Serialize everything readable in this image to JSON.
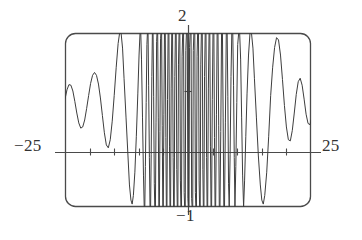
{
  "figure": {
    "kind": "graphing-calculator-viewport",
    "title": "",
    "frame": {
      "left_px": 65,
      "right_px": 311,
      "top_px": 33,
      "bottom_px": 207,
      "corner_radius_px": 10,
      "stroke_color": "#4a4a4a"
    },
    "labels": {
      "x_min": "−25",
      "x_max": "25",
      "y_max": "2",
      "y_min": "−1"
    },
    "axes": {
      "x_axis_y_px": 152,
      "y_axis_x_px": 188,
      "x_tick_values": [
        -20,
        -15,
        -10,
        -5,
        5,
        10,
        15,
        20
      ],
      "y_tick_values": [
        1
      ],
      "tick_length_px": 7,
      "stroke_color": "#4a4a4a"
    }
  },
  "chart_data": {
    "type": "line",
    "title": "",
    "xlabel": "",
    "ylabel": "",
    "xlim": [
      -25,
      25
    ],
    "ylim": [
      -1,
      2
    ],
    "grid": false,
    "legend": "none",
    "xticks": [
      -20,
      -15,
      -10,
      -5,
      0,
      5,
      10,
      15,
      20
    ],
    "yticks": [
      -1,
      0,
      1,
      2
    ],
    "series": [
      {
        "name": "f(x)",
        "description": "rapidly oscillating curve, frequency increases toward center, clipped at viewport top and bottom",
        "stroke_color": "#3d3d3d",
        "stroke_width": 1,
        "points": [
          [
            -25.0,
            0.86
          ],
          [
            -24.6,
            1.02
          ],
          [
            -24.2,
            1.11
          ],
          [
            -23.8,
            1.1
          ],
          [
            -23.4,
            1.0
          ],
          [
            -23.0,
            0.82
          ],
          [
            -22.6,
            0.62
          ],
          [
            -22.2,
            0.45
          ],
          [
            -21.8,
            0.36
          ],
          [
            -21.4,
            0.38
          ],
          [
            -21.0,
            0.5
          ],
          [
            -20.6,
            0.7
          ],
          [
            -20.2,
            0.92
          ],
          [
            -19.8,
            1.13
          ],
          [
            -19.4,
            1.27
          ],
          [
            -19.0,
            1.32
          ],
          [
            -18.6,
            1.27
          ],
          [
            -18.2,
            1.12
          ],
          [
            -17.8,
            0.88
          ],
          [
            -17.4,
            0.58
          ],
          [
            -17.0,
            0.28
          ],
          [
            -16.6,
            0.07
          ],
          [
            -16.2,
            0.02
          ],
          [
            -15.8,
            0.16
          ],
          [
            -15.4,
            0.48
          ],
          [
            -15.0,
            0.92
          ],
          [
            -14.6,
            1.4
          ],
          [
            -14.2,
            1.82
          ],
          [
            -13.9,
            2.0
          ],
          [
            -13.6,
            2.0
          ],
          [
            -13.3,
            1.74
          ],
          [
            -13.0,
            1.22
          ],
          [
            -12.6,
            0.55
          ],
          [
            -12.2,
            -0.12
          ],
          [
            -11.9,
            -0.62
          ],
          [
            -11.6,
            -0.88
          ],
          [
            -11.35,
            -0.95
          ],
          [
            -11.1,
            -0.8
          ],
          [
            -10.8,
            -0.4
          ],
          [
            -10.5,
            0.22
          ],
          [
            -10.2,
            0.95
          ],
          [
            -9.95,
            1.62
          ],
          [
            -9.75,
            2.0
          ],
          [
            -9.6,
            2.0
          ],
          [
            -9.45,
            1.55
          ],
          [
            -9.25,
            0.55
          ],
          [
            -9.05,
            -0.45
          ],
          [
            -8.9,
            -1.0
          ],
          [
            -8.78,
            -1.0
          ],
          [
            -8.66,
            -0.3
          ],
          [
            -8.5,
            0.8
          ],
          [
            -8.35,
            1.8
          ],
          [
            -8.25,
            2.0
          ],
          [
            -8.12,
            2.0
          ],
          [
            -8.0,
            1.1
          ],
          [
            -7.85,
            -0.15
          ],
          [
            -7.72,
            -1.0
          ],
          [
            -7.6,
            -1.0
          ],
          [
            -7.48,
            -0.1
          ],
          [
            -7.35,
            1.25
          ],
          [
            -7.24,
            2.0
          ],
          [
            -7.1,
            2.0
          ],
          [
            -6.98,
            0.9
          ],
          [
            -6.85,
            -0.6
          ],
          [
            -6.75,
            -1.0
          ],
          [
            -6.62,
            -1.0
          ],
          [
            -6.5,
            0.45
          ],
          [
            -6.38,
            1.85
          ],
          [
            -6.3,
            2.0
          ],
          [
            -6.16,
            2.0
          ],
          [
            -6.04,
            0.55
          ],
          [
            -5.92,
            -1.0
          ],
          [
            -5.82,
            -1.0
          ],
          [
            -5.7,
            0.3
          ],
          [
            -5.58,
            1.9
          ],
          [
            -5.5,
            2.0
          ],
          [
            -5.36,
            2.0
          ],
          [
            -5.24,
            0.4
          ],
          [
            -5.12,
            -1.0
          ],
          [
            -5.02,
            -1.0
          ],
          [
            -4.9,
            0.6
          ],
          [
            -4.78,
            2.0
          ],
          [
            -4.62,
            2.0
          ],
          [
            -4.5,
            0.2
          ],
          [
            -4.4,
            -1.0
          ],
          [
            -4.28,
            -1.0
          ],
          [
            -4.16,
            0.85
          ],
          [
            -4.04,
            2.0
          ],
          [
            -3.88,
            2.0
          ],
          [
            -3.76,
            0.05
          ],
          [
            -3.66,
            -1.0
          ],
          [
            -3.54,
            -1.0
          ],
          [
            -3.42,
            1.05
          ],
          [
            -3.3,
            2.0
          ],
          [
            -3.14,
            2.0
          ],
          [
            -3.02,
            -0.15
          ],
          [
            -2.92,
            -1.0
          ],
          [
            -2.8,
            -1.0
          ],
          [
            -2.68,
            1.25
          ],
          [
            -2.56,
            2.0
          ],
          [
            -2.4,
            2.0
          ],
          [
            -2.28,
            -0.35
          ],
          [
            -2.18,
            -1.0
          ],
          [
            -2.06,
            -1.0
          ],
          [
            -1.94,
            1.45
          ],
          [
            -1.82,
            2.0
          ],
          [
            -1.66,
            2.0
          ],
          [
            -1.54,
            -0.55
          ],
          [
            -1.44,
            -1.0
          ],
          [
            -1.32,
            -1.0
          ],
          [
            -1.2,
            1.6
          ],
          [
            -1.08,
            2.0
          ],
          [
            -0.9,
            2.0
          ],
          [
            -0.78,
            -0.75
          ],
          [
            -0.68,
            -1.0
          ],
          [
            -0.56,
            -1.0
          ],
          [
            -0.44,
            1.7
          ],
          [
            -0.32,
            2.0
          ],
          [
            -0.14,
            2.0
          ],
          [
            -0.02,
            -0.85
          ],
          [
            0.08,
            -1.0
          ],
          [
            0.2,
            -1.0
          ],
          [
            0.32,
            1.75
          ],
          [
            0.44,
            2.0
          ],
          [
            0.62,
            2.0
          ],
          [
            0.74,
            -0.85
          ],
          [
            0.84,
            -1.0
          ],
          [
            0.96,
            -1.0
          ],
          [
            1.08,
            1.7
          ],
          [
            1.2,
            2.0
          ],
          [
            1.38,
            2.0
          ],
          [
            1.5,
            -0.75
          ],
          [
            1.6,
            -1.0
          ],
          [
            1.72,
            -1.0
          ],
          [
            1.84,
            1.6
          ],
          [
            1.96,
            2.0
          ],
          [
            2.14,
            2.0
          ],
          [
            2.26,
            -0.55
          ],
          [
            2.36,
            -1.0
          ],
          [
            2.48,
            -1.0
          ],
          [
            2.6,
            1.45
          ],
          [
            2.72,
            2.0
          ],
          [
            2.9,
            2.0
          ],
          [
            3.02,
            -0.35
          ],
          [
            3.12,
            -1.0
          ],
          [
            3.24,
            -1.0
          ],
          [
            3.36,
            1.25
          ],
          [
            3.5,
            2.0
          ],
          [
            3.66,
            2.0
          ],
          [
            3.78,
            -0.15
          ],
          [
            3.88,
            -1.0
          ],
          [
            4.0,
            -1.0
          ],
          [
            4.14,
            1.05
          ],
          [
            4.28,
            2.0
          ],
          [
            4.44,
            2.0
          ],
          [
            4.56,
            0.05
          ],
          [
            4.68,
            -1.0
          ],
          [
            4.8,
            -1.0
          ],
          [
            4.94,
            0.85
          ],
          [
            5.08,
            2.0
          ],
          [
            5.26,
            2.0
          ],
          [
            5.38,
            0.2
          ],
          [
            5.5,
            -1.0
          ],
          [
            5.62,
            -1.0
          ],
          [
            5.78,
            0.6
          ],
          [
            5.92,
            2.0
          ],
          [
            6.1,
            2.0
          ],
          [
            6.24,
            0.4
          ],
          [
            6.36,
            -1.0
          ],
          [
            6.5,
            -1.0
          ],
          [
            6.66,
            0.3
          ],
          [
            6.82,
            2.0
          ],
          [
            7.0,
            2.0
          ],
          [
            7.14,
            0.55
          ],
          [
            7.28,
            -1.0
          ],
          [
            7.42,
            -1.0
          ],
          [
            7.6,
            0.45
          ],
          [
            7.78,
            2.0
          ],
          [
            7.96,
            2.0
          ],
          [
            8.1,
            0.9
          ],
          [
            8.24,
            -0.6
          ],
          [
            8.38,
            -1.0
          ],
          [
            8.56,
            -0.1
          ],
          [
            8.74,
            1.25
          ],
          [
            8.9,
            2.0
          ],
          [
            9.1,
            2.0
          ],
          [
            9.26,
            1.1
          ],
          [
            9.4,
            -0.15
          ],
          [
            9.54,
            -1.0
          ],
          [
            9.72,
            -0.3
          ],
          [
            9.92,
            0.8
          ],
          [
            10.1,
            1.8
          ],
          [
            10.3,
            2.0
          ],
          [
            10.5,
            2.0
          ],
          [
            10.7,
            1.55
          ],
          [
            10.9,
            0.55
          ],
          [
            11.1,
            -0.45
          ],
          [
            11.3,
            -1.0
          ],
          [
            11.5,
            -0.55
          ],
          [
            11.75,
            0.22
          ],
          [
            12.0,
            0.95
          ],
          [
            12.3,
            1.62
          ],
          [
            12.6,
            2.0
          ],
          [
            12.9,
            2.0
          ],
          [
            13.2,
            1.74
          ],
          [
            13.5,
            1.22
          ],
          [
            13.9,
            0.55
          ],
          [
            14.3,
            -0.12
          ],
          [
            14.7,
            -0.62
          ],
          [
            15.0,
            -0.88
          ],
          [
            15.3,
            -0.95
          ],
          [
            15.6,
            -0.8
          ],
          [
            16.0,
            -0.4
          ],
          [
            16.4,
            0.22
          ],
          [
            16.8,
            0.92
          ],
          [
            17.2,
            1.4
          ],
          [
            17.6,
            1.75
          ],
          [
            18.0,
            1.92
          ],
          [
            18.4,
            1.88
          ],
          [
            18.8,
            1.62
          ],
          [
            19.2,
            1.2
          ],
          [
            19.6,
            0.75
          ],
          [
            20.0,
            0.38
          ],
          [
            20.4,
            0.16
          ],
          [
            20.8,
            0.14
          ],
          [
            21.2,
            0.32
          ],
          [
            21.6,
            0.62
          ],
          [
            22.0,
            0.94
          ],
          [
            22.4,
            1.16
          ],
          [
            22.8,
            1.22
          ],
          [
            23.2,
            1.1
          ],
          [
            23.6,
            0.86
          ],
          [
            24.0,
            0.6
          ],
          [
            24.4,
            0.44
          ],
          [
            24.8,
            0.42
          ],
          [
            25.0,
            0.5
          ]
        ]
      }
    ]
  }
}
